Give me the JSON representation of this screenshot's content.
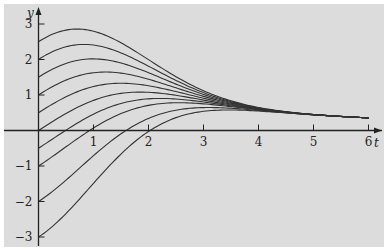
{
  "chart_data": {
    "type": "line",
    "title": "",
    "xlabel": "t",
    "ylabel": "y",
    "xlim": [
      0,
      6.2
    ],
    "ylim": [
      -3.2,
      3.3
    ],
    "grid": false,
    "legend": null,
    "x_ticks": [
      "1",
      "2",
      "3",
      "4",
      "5",
      "6"
    ],
    "y_ticks": [
      "3",
      "2",
      "1",
      "-1",
      "-2",
      "-3"
    ],
    "x": [
      0,
      0.5,
      1,
      1.5,
      2,
      2.5,
      3,
      3.5,
      4,
      4.5,
      5,
      5.5,
      6
    ],
    "limit_curve": [
      0,
      0.49,
      0.85,
      1.06,
      1.08,
      0.99,
      0.86,
      0.73,
      0.6,
      0.52,
      0.45,
      0.4,
      0.36
    ],
    "decay": [
      1,
      0.9394,
      0.7788,
      0.5698,
      0.3679,
      0.2096,
      0.1054,
      0.0468,
      0.0183,
      0.0063,
      0.0019,
      0.0005,
      0.0001
    ],
    "initial_values": [
      2.5,
      2,
      1.5,
      1,
      0.5,
      0,
      -0.5,
      -1,
      -2,
      -3
    ],
    "series_note": "Each curve y(t) = limit_curve(t) + y0 * decay(t)"
  },
  "axis": {
    "x_label": "t",
    "y_label": "y"
  }
}
